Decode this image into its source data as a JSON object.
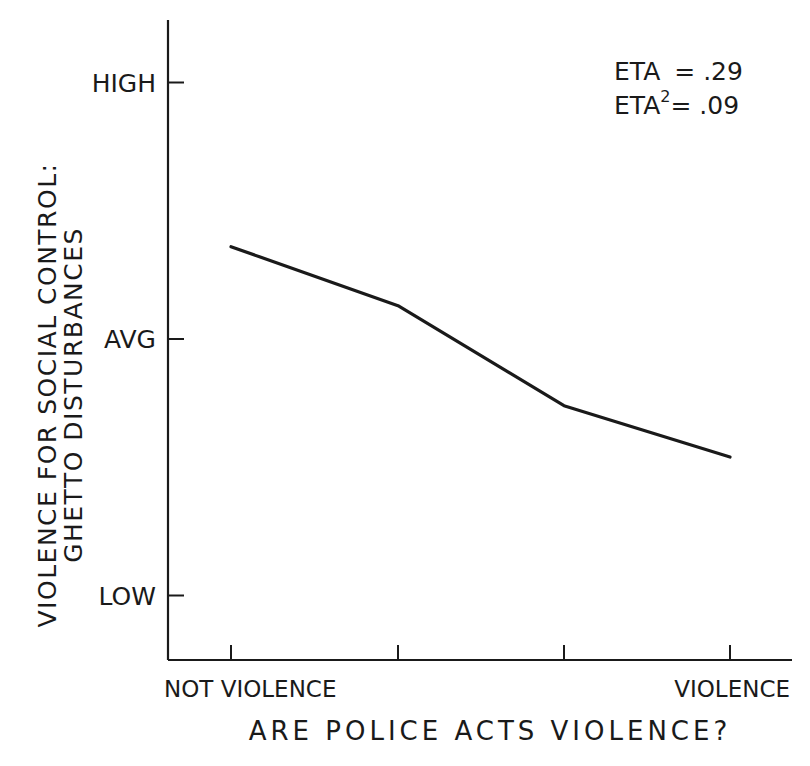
{
  "chart_data": {
    "type": "line",
    "title": "",
    "xlabel": "ARE POLICE ACTS VIOLENCE?",
    "ylabel": [
      "VIOLENCE FOR SOCIAL CONTROL:",
      "GHETTO DISTURBANCES"
    ],
    "x_ticks": [
      "NOT VIOLENCE",
      "",
      "",
      "VIOLENCE"
    ],
    "y_ticks": [
      {
        "label": "HIGH",
        "value": 1
      },
      {
        "label": "AVG",
        "value": 0
      },
      {
        "label": "LOW",
        "value": -1
      }
    ],
    "ylim": [
      -1.25,
      1.25
    ],
    "grid": false,
    "legend": null,
    "categories": [
      1,
      2,
      3,
      4
    ],
    "series": [
      {
        "name": "Violence for social control",
        "values": [
          0.36,
          0.13,
          -0.26,
          -0.46
        ]
      }
    ],
    "annotations": [
      {
        "text": "ETA = .29"
      },
      {
        "text": "ETA² = .09"
      }
    ]
  },
  "annotation": {
    "eta_label": "ETA",
    "eta_value": "= .29",
    "eta2_label": "ETA",
    "eta2_sup": "2",
    "eta2_value": "= .09"
  }
}
